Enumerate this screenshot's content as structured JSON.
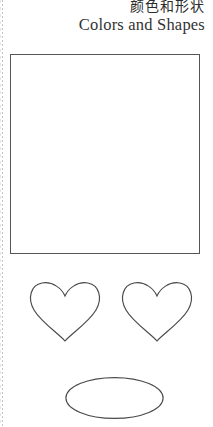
{
  "page": {
    "background_color": "#ffffff",
    "width": 213,
    "height": 427
  },
  "header": {
    "title_cn": "颜色和形状",
    "title_en": "Colors and Shapes",
    "text_color": "#2b2b2b"
  },
  "content": {
    "frame_box": {
      "name": "empty-rectangle",
      "stroke_color": "#555555",
      "fill_color": "#ffffff"
    },
    "shapes": [
      {
        "name": "heart",
        "label": "heart-left",
        "stroke_color": "#4a4a4a",
        "fill_color": "#ffffff"
      },
      {
        "name": "heart",
        "label": "heart-right",
        "stroke_color": "#4a4a4a",
        "fill_color": "#ffffff"
      },
      {
        "name": "ellipse",
        "label": "oval",
        "stroke_color": "#4a4a4a",
        "fill_color": "#ffffff"
      }
    ]
  },
  "artifacts": {
    "left_edge_line": {
      "name": "scan-binding-line",
      "color": "#b9b9b9"
    }
  }
}
